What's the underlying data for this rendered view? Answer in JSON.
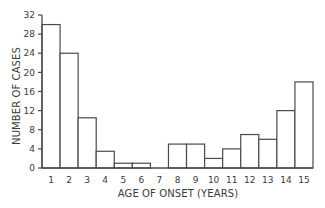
{
  "chart_data": {
    "type": "bar",
    "title": "",
    "xlabel": "AGE OF ONSET (YEARS)",
    "ylabel": "NUMBER OF CASES",
    "categories": [
      "1",
      "2",
      "3",
      "4",
      "5",
      "6",
      "7",
      "8",
      "9",
      "10",
      "11",
      "12",
      "13",
      "14",
      "15"
    ],
    "values": [
      30,
      24,
      10.5,
      3.5,
      1,
      1,
      0,
      5,
      5,
      2,
      4,
      7,
      6,
      12,
      18
    ],
    "ylim": [
      0,
      32
    ],
    "yticks": [
      0,
      4,
      8,
      12,
      16,
      20,
      24,
      28,
      32
    ],
    "grid": false,
    "legend": null,
    "colors": {
      "bar_fill": "#ffffff",
      "bar_stroke": "#4a4a4a",
      "axis": "#4a4a4a",
      "text": "#3a3a3a"
    }
  }
}
